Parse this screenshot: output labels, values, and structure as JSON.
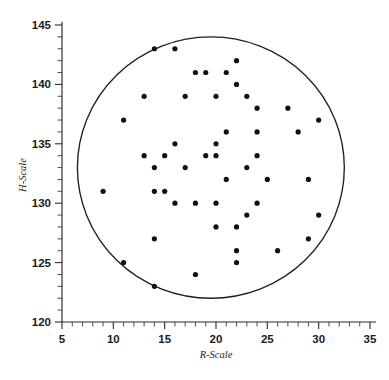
{
  "chart_data": {
    "type": "scatter",
    "title": "",
    "subtitle": "",
    "xlabel": "R-Scale",
    "ylabel": "H-Scale",
    "xlim": [
      5,
      35
    ],
    "ylim": [
      120,
      145
    ],
    "x_major_ticks": [
      5,
      10,
      15,
      20,
      25,
      30,
      35
    ],
    "y_major_ticks": [
      120,
      125,
      130,
      135,
      140,
      145
    ],
    "x_minor_tick_step": 1,
    "y_minor_tick_step": 1,
    "x_tick_labels": [
      "5",
      "10",
      "15",
      "20",
      "25",
      "30",
      "35"
    ],
    "y_tick_labels": [
      "120",
      "125",
      "130",
      "135",
      "140",
      "145"
    ],
    "grid": false,
    "legend": null,
    "legend_position": "none",
    "annotations": [
      {
        "kind": "circle",
        "label": "tolerance-boundary-circle",
        "center_x": 19.5,
        "center_y": 133.0,
        "radius_x": 13.0,
        "radius_y": 11.0
      }
    ],
    "point_color": "#111111",
    "point_marker": "filled-circle",
    "point_count": 58,
    "x": [
      14,
      16,
      22,
      18,
      19,
      21,
      22,
      13,
      17,
      20,
      24,
      11,
      30,
      21,
      24,
      28,
      13,
      15,
      16,
      20,
      21,
      29,
      14,
      17,
      20,
      21,
      25,
      23,
      9,
      14,
      15,
      16,
      18,
      20,
      24,
      23,
      30,
      14,
      22,
      26,
      29,
      22,
      20,
      22,
      18,
      14,
      27,
      25,
      23,
      26,
      22,
      19,
      11,
      24,
      28,
      12,
      25,
      31
    ],
    "y": [
      143,
      143,
      142,
      141,
      141,
      141,
      140,
      139,
      139,
      139,
      138,
      137,
      137,
      136,
      136,
      136,
      134,
      134,
      135,
      135,
      132,
      132,
      133,
      133,
      134,
      134,
      132,
      133,
      131,
      131,
      131,
      130,
      130,
      130,
      130,
      129,
      129,
      127,
      128,
      126,
      127,
      126,
      128,
      125,
      124,
      123,
      138,
      134,
      139,
      126,
      125,
      141,
      137,
      138,
      136,
      131,
      132,
      132
    ],
    "points": [
      {
        "x": 14,
        "y": 143
      },
      {
        "x": 16,
        "y": 143
      },
      {
        "x": 22,
        "y": 142
      },
      {
        "x": 18,
        "y": 141
      },
      {
        "x": 19,
        "y": 141
      },
      {
        "x": 21,
        "y": 141
      },
      {
        "x": 22,
        "y": 140
      },
      {
        "x": 13,
        "y": 139
      },
      {
        "x": 17,
        "y": 139
      },
      {
        "x": 20,
        "y": 139
      },
      {
        "x": 23,
        "y": 139
      },
      {
        "x": 24,
        "y": 138
      },
      {
        "x": 27,
        "y": 138
      },
      {
        "x": 11,
        "y": 137
      },
      {
        "x": 30,
        "y": 137
      },
      {
        "x": 21,
        "y": 136
      },
      {
        "x": 24,
        "y": 136
      },
      {
        "x": 28,
        "y": 136
      },
      {
        "x": 16,
        "y": 135
      },
      {
        "x": 20,
        "y": 135
      },
      {
        "x": 13,
        "y": 134
      },
      {
        "x": 15,
        "y": 134
      },
      {
        "x": 19,
        "y": 134
      },
      {
        "x": 20,
        "y": 134
      },
      {
        "x": 24,
        "y": 134
      },
      {
        "x": 14,
        "y": 133
      },
      {
        "x": 17,
        "y": 133
      },
      {
        "x": 23,
        "y": 133
      },
      {
        "x": 21,
        "y": 132
      },
      {
        "x": 25,
        "y": 132
      },
      {
        "x": 29,
        "y": 132
      },
      {
        "x": 9,
        "y": 131
      },
      {
        "x": 14,
        "y": 131
      },
      {
        "x": 15,
        "y": 131
      },
      {
        "x": 16,
        "y": 130
      },
      {
        "x": 18,
        "y": 130
      },
      {
        "x": 20,
        "y": 130
      },
      {
        "x": 24,
        "y": 130
      },
      {
        "x": 23,
        "y": 129
      },
      {
        "x": 30,
        "y": 129
      },
      {
        "x": 20,
        "y": 128
      },
      {
        "x": 22,
        "y": 128
      },
      {
        "x": 14,
        "y": 127
      },
      {
        "x": 29,
        "y": 127
      },
      {
        "x": 22,
        "y": 126
      },
      {
        "x": 26,
        "y": 126
      },
      {
        "x": 22,
        "y": 125
      },
      {
        "x": 11,
        "y": 125
      },
      {
        "x": 18,
        "y": 124
      },
      {
        "x": 14,
        "y": 123
      }
    ]
  }
}
